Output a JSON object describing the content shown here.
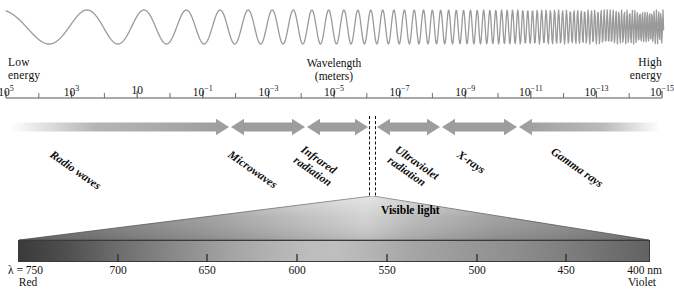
{
  "diagram": {
    "wave": {
      "name": "wave-illustration",
      "description": "sinusoid increasing in frequency from left to right",
      "stroke_color": "#9a9a9a"
    },
    "energy_left_label": "Low\nenergy",
    "energy_right_label": "High\nenergy",
    "axis_caption": "Wavelength\n(meters)",
    "axis": {
      "unit": "meters",
      "tick_labels": [
        {
          "mantissa": "10",
          "exponent": "5",
          "x_pct": 4.2
        },
        {
          "mantissa": "10",
          "exponent": "3",
          "x_pct": 15.5
        },
        {
          "mantissa": "10",
          "exponent": "",
          "x_pct": 26.6
        },
        {
          "mantissa": "10",
          "exponent": "-1",
          "x_pct": 37.8
        },
        {
          "mantissa": "10",
          "exponent": "-3",
          "x_pct": 49.0
        },
        {
          "mantissa": "10",
          "exponent": "-5",
          "x_pct": 60.2
        },
        {
          "mantissa": "10",
          "exponent": "-7",
          "x_pct": 71.3
        },
        {
          "mantissa": "10",
          "exponent": "-9",
          "x_pct": 82.5
        },
        {
          "mantissa": "10",
          "exponent": "-11",
          "x_pct": 93.7
        },
        {
          "mantissa": "10",
          "exponent": "-13",
          "x_pct": 104.8
        },
        {
          "mantissa": "10",
          "exponent": "-15",
          "x_pct": 116.0
        }
      ],
      "line_color": "#8d8d8d",
      "tick_color": "#6f6f6f"
    },
    "bands": [
      {
        "label": "Radio waves",
        "x0": 10,
        "x1": 229,
        "arrows": "right",
        "fade": "left"
      },
      {
        "label": "Microwaves",
        "x0": 231,
        "x1": 305,
        "arrows": "both",
        "fade": "none"
      },
      {
        "label": "Infrared\nradiation",
        "x0": 307,
        "x1": 368,
        "arrows": "both",
        "fade": "none"
      },
      {
        "label": "Ultraviolet\nradiation",
        "x0": 377,
        "x1": 440,
        "arrows": "both",
        "fade": "none"
      },
      {
        "label": "X-rays",
        "x0": 442,
        "x1": 517,
        "arrows": "both",
        "fade": "none"
      },
      {
        "label": "Gamma rays",
        "x0": 519,
        "x1": 660,
        "arrows": "left",
        "fade": "right"
      }
    ],
    "visible_light_label": "Visible light",
    "visible_scale": {
      "lambda_label": "λ = 750",
      "left_color_name": "Red",
      "right_color_name": "Violet",
      "unit_suffix": "nm",
      "ticks": [
        {
          "label": "750",
          "x": 28,
          "is_lambda": true
        },
        {
          "label": "700",
          "x": 118,
          "is_lambda": false
        },
        {
          "label": "650",
          "x": 207,
          "is_lambda": false
        },
        {
          "label": "600",
          "x": 297,
          "is_lambda": false
        },
        {
          "label": "550",
          "x": 387,
          "is_lambda": false
        },
        {
          "label": "500",
          "x": 477,
          "is_lambda": false
        },
        {
          "label": "450",
          "x": 566,
          "is_lambda": false
        },
        {
          "label": "400",
          "x": 648,
          "is_lambda": false
        }
      ]
    },
    "colors": {
      "wave_stroke": "#9a9a9a",
      "arrow_gray": "#9d9d9d",
      "bar_border": "#3a3a3a",
      "text": "#111111",
      "background": "#ffffff"
    }
  },
  "chart_data": {
    "type": "line",
    "xlabel": "Wavelength (meters)",
    "ylabel": "",
    "grid": false,
    "legend": "none",
    "x_scale": "log (decreasing left to right)",
    "xlim": [
      100000,
      1e-15
    ],
    "x_tick_values": [
      100000.0,
      1000.0,
      10.0,
      0.1,
      0.001,
      1e-05,
      1e-07,
      1e-09,
      1e-11,
      1e-13,
      1e-15
    ],
    "x_tick_labels": [
      "10^5",
      "10^3",
      "10",
      "10^-1",
      "10^-3",
      "10^-5",
      "10^-7",
      "10^-9",
      "10^-11",
      "10^-13",
      "10^-15"
    ],
    "annotations": [
      "Low energy",
      "High energy",
      "Wavelength (meters)",
      "Visible light"
    ],
    "series": [
      {
        "name": "Spectrum bands",
        "values": [
          {
            "band": "Radio waves",
            "wavelength_min_m": 0.001,
            "wavelength_max_m": 100000.0
          },
          {
            "band": "Microwaves",
            "wavelength_min_m": 0.0001,
            "wavelength_max_m": 0.001
          },
          {
            "band": "Infrared radiation",
            "wavelength_min_m": 7e-07,
            "wavelength_max_m": 0.0001
          },
          {
            "band": "Visible light",
            "wavelength_min_m": 4e-07,
            "wavelength_max_m": 7.5e-07
          },
          {
            "band": "Ultraviolet radiation",
            "wavelength_min_m": 1e-08,
            "wavelength_max_m": 4e-07
          },
          {
            "band": "X-rays",
            "wavelength_min_m": 1e-11,
            "wavelength_max_m": 1e-08
          },
          {
            "band": "Gamma rays",
            "wavelength_min_m": 1e-15,
            "wavelength_max_m": 1e-11
          }
        ]
      },
      {
        "name": "Visible light scale (nm)",
        "categories": [
          750,
          700,
          650,
          600,
          550,
          500,
          450,
          400
        ],
        "endpoints": {
          "left": "Red (750 nm)",
          "right": "Violet (400 nm)"
        }
      }
    ]
  }
}
